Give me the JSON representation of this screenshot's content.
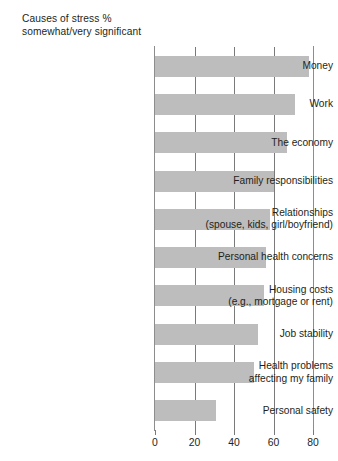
{
  "chart_data": {
    "type": "bar",
    "orientation": "horizontal",
    "title": "Causes of stress %\nsomewhat/very significant",
    "xlabel": "",
    "ylabel": "",
    "xlim": [
      0,
      80
    ],
    "xticks": [
      0,
      20,
      40,
      60,
      80
    ],
    "xtick_labels": [
      "0",
      "20",
      "40",
      "60",
      "80"
    ],
    "grid": true,
    "grid_axis": "x",
    "legend": false,
    "bar_color": "#bdbdbd",
    "axis_color": "#7a7a7a",
    "categories": [
      "Money",
      "Work",
      "The economy",
      "Family responsibilities",
      "Relationships\n(spouse, kids, girl/boyfriend)",
      "Personal health concerns",
      "Housing costs\n(e.g., mortgage or rent)",
      "Job stability",
      "Health problems\naffecting my family",
      "Personal safety"
    ],
    "values": [
      78,
      71,
      67,
      60,
      58,
      56,
      55,
      52,
      50,
      31
    ]
  }
}
